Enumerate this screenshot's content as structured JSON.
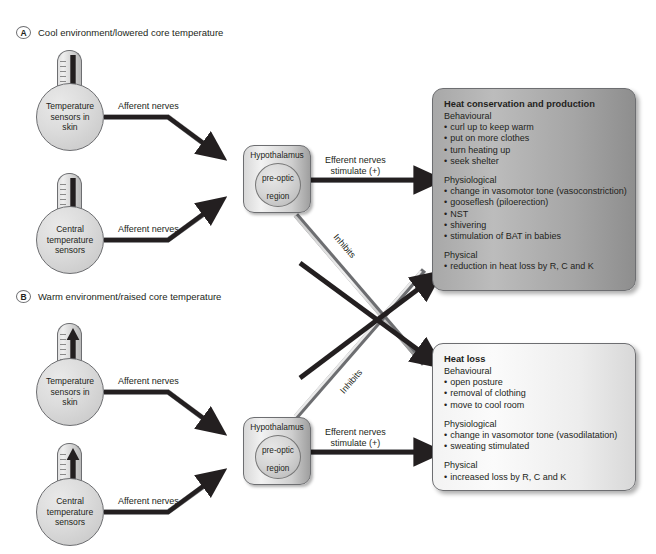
{
  "figure": {
    "width": 656,
    "height": 554,
    "background": "#ffffff"
  },
  "panels": [
    {
      "badge": "A",
      "title": "Cool environment/lowered core temperature"
    },
    {
      "badge": "B",
      "title": "Warm environment/raised core temperature"
    }
  ],
  "sensors": [
    {
      "id": "skin-sensor-cool",
      "label": "Temperature\nsensors in\nskin",
      "line1": "Temperature",
      "line2": "sensors in",
      "line3": "skin",
      "thermo_arrow": "down"
    },
    {
      "id": "central-sensor-cool",
      "label": "Central\ntemperature\nsensors",
      "line1": "Central",
      "line2": "temperature",
      "line3": "sensors",
      "thermo_arrow": "down"
    },
    {
      "id": "skin-sensor-warm",
      "label": "Temperature\nsensors in\nskin",
      "line1": "Temperature",
      "line2": "sensors in",
      "line3": "skin",
      "thermo_arrow": "up"
    },
    {
      "id": "central-sensor-warm",
      "label": "Central\ntemperature\nsensors",
      "line1": "Central",
      "line2": "temperature",
      "line3": "sensors",
      "thermo_arrow": "up"
    }
  ],
  "hypothalamus": {
    "title": "Hypothalamus",
    "region_line1": "pre-optic",
    "region_line2": "region"
  },
  "edges": {
    "afferent": "Afferent nerves",
    "efferent_line1": "Efferent nerves",
    "efferent_line2": "stimulate (+)",
    "inhibits": "Inhibits"
  },
  "outcome_boxes": [
    {
      "id": "heat-conservation",
      "title": "Heat conservation and production",
      "groups": [
        {
          "heading": "Behavioural",
          "items": [
            "curl up to keep warm",
            "put on more clothes",
            "turn heating up",
            "seek shelter"
          ]
        },
        {
          "heading": "Physiological",
          "items": [
            "change in vasomotor tone (vasoconstriction)",
            "gooseflesh (piloerection)",
            "NST",
            "shivering",
            "stimulation of BAT in babies"
          ]
        },
        {
          "heading": "Physical",
          "items": [
            "reduction in heat loss by R, C and K"
          ]
        }
      ]
    },
    {
      "id": "heat-loss",
      "title": "Heat loss",
      "groups": [
        {
          "heading": "Behavioural",
          "items": [
            "open posture",
            "removal of clothing",
            "move to cool room"
          ]
        },
        {
          "heading": "Physiological",
          "items": [
            "change in vasomotor tone (vasodilatation)",
            "sweating stimulated"
          ]
        },
        {
          "heading": "Physical",
          "items": [
            "increased loss by R, C and K"
          ]
        }
      ]
    }
  ],
  "colors": {
    "outline": "#6d6e71",
    "text": "#231f20",
    "dark_box": "#a8a8a8",
    "light_box": "#f3f3f3",
    "arrow_dark": "#231f20",
    "arrow_grey": "#9a9a9a"
  }
}
